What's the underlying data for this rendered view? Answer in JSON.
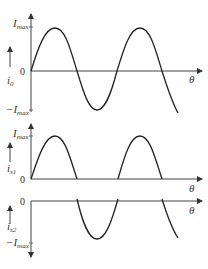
{
  "figure": {
    "panels": [
      {
        "id": "i0",
        "y_label": "i",
        "y_label_sub": "0",
        "top_label": "I",
        "top_label_sub": "max",
        "zero_label": "0",
        "bottom_label": "−I",
        "bottom_label_sub": "max",
        "x_label": "θ",
        "waveform": "full sine"
      },
      {
        "id": "is1",
        "y_label": "i",
        "y_label_sub": "s1",
        "top_label": "I",
        "top_label_sub": "max",
        "zero_label": "0",
        "x_label": "θ",
        "waveform": "positive half-cycles"
      },
      {
        "id": "is2",
        "y_label": "i",
        "y_label_sub": "s2",
        "zero_label": "0",
        "bottom_label": "−I",
        "bottom_label_sub": "max",
        "x_label": "θ",
        "waveform": "negative half-cycles"
      }
    ],
    "colors": {
      "line": "#222222",
      "axis": "#444444",
      "text": "#333333"
    }
  }
}
